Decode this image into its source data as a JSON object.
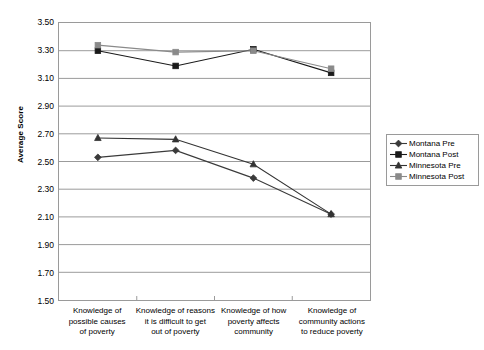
{
  "chart": {
    "type": "line",
    "ylabel": "Average Score",
    "xlabel": ""
  },
  "axis": {
    "y_ticks": [
      "3.50",
      "3.30",
      "3.10",
      "2.90",
      "2.70",
      "2.50",
      "2.30",
      "2.10",
      "1.90",
      "1.70",
      "1.50"
    ]
  },
  "categories": [
    {
      "line1": "Knowledge of",
      "line2": "possible causes",
      "line3": "of poverty"
    },
    {
      "line1": "Knowledge of reasons",
      "line2": "it is difficult to get",
      "line3": "out of poverty"
    },
    {
      "line1": "Knowledge of how",
      "line2": "poverty affects",
      "line3": "community"
    },
    {
      "line1": "Knowledge of",
      "line2": "community actions",
      "line3": "to reduce poverty"
    }
  ],
  "legend": {
    "items": [
      {
        "label": "Montana Pre",
        "marker": "diamond",
        "color": "#3a3a3a"
      },
      {
        "label": "Montana Post",
        "marker": "square-dark",
        "color": "#1a1a1a"
      },
      {
        "label": "Minnesota Pre",
        "marker": "triangle",
        "color": "#333333"
      },
      {
        "label": "Minnesota Post",
        "marker": "square-gray",
        "color": "#8a8a8a"
      }
    ]
  },
  "chart_data": {
    "type": "line",
    "title": "",
    "xlabel": "",
    "ylabel": "Average Score",
    "ylim": [
      1.5,
      3.5
    ],
    "ytick_step": 0.2,
    "grid": true,
    "legend_position": "right",
    "categories": [
      "Knowledge of possible causes of poverty",
      "Knowledge of reasons it is difficult to get out of poverty",
      "Knowledge of how poverty affects community",
      "Knowledge of community actions to reduce poverty"
    ],
    "series": [
      {
        "name": "Montana Pre",
        "marker": "diamond",
        "color": "#3a3a3a",
        "values": [
          2.53,
          2.58,
          2.38,
          2.12
        ]
      },
      {
        "name": "Montana Post",
        "marker": "square-dark",
        "color": "#1a1a1a",
        "values": [
          3.3,
          3.19,
          3.31,
          3.14
        ]
      },
      {
        "name": "Minnesota Pre",
        "marker": "triangle",
        "color": "#333333",
        "values": [
          2.67,
          2.66,
          2.48,
          2.12
        ]
      },
      {
        "name": "Minnesota Post",
        "marker": "square-gray",
        "color": "#8a8a8a",
        "values": [
          3.34,
          3.29,
          3.3,
          3.17
        ]
      }
    ]
  }
}
